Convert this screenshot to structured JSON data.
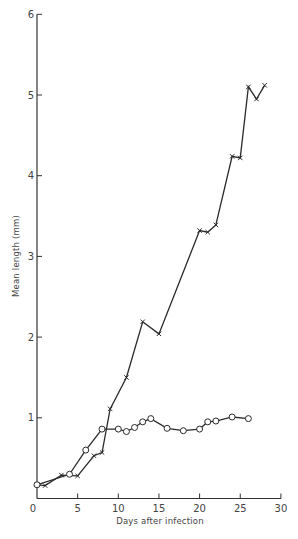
{
  "chart_data": {
    "type": "line",
    "title": "",
    "xlabel": "Days after infection",
    "ylabel": "Mean length (mm)",
    "xlim": [
      0,
      30
    ],
    "ylim": [
      0,
      6
    ],
    "xticks": [
      0,
      5,
      10,
      15,
      20,
      25,
      30
    ],
    "xtick_labels": [
      "0",
      "5",
      "10",
      "15",
      "20",
      "25",
      "30"
    ],
    "yticks": [
      1,
      2,
      3,
      4,
      5,
      6
    ],
    "ytick_labels": [
      "1",
      "2",
      "3",
      "4",
      "5",
      "6"
    ],
    "grid": false,
    "legend": null,
    "series": [
      {
        "name": "crosses",
        "marker": "x",
        "x": [
          0,
          1,
          3,
          5,
          7,
          8,
          9,
          11,
          13,
          15,
          20,
          21,
          22,
          24,
          25,
          26,
          27,
          28
        ],
        "y": [
          0.17,
          0.16,
          0.29,
          0.28,
          0.53,
          0.57,
          1.11,
          1.5,
          2.19,
          2.04,
          3.32,
          3.3,
          3.39,
          4.24,
          4.22,
          5.1,
          4.95,
          5.12
        ]
      },
      {
        "name": "circles",
        "marker": "o",
        "x": [
          0,
          4,
          6,
          8,
          10,
          11,
          12,
          13,
          14,
          16,
          18,
          20,
          21,
          22,
          24,
          26
        ],
        "y": [
          0.17,
          0.3,
          0.6,
          0.86,
          0.86,
          0.83,
          0.88,
          0.95,
          0.99,
          0.87,
          0.84,
          0.86,
          0.95,
          0.96,
          1.01,
          0.99
        ]
      }
    ]
  },
  "layout": {
    "x0": 37,
    "x_per_unit": 8.13,
    "y0": 498.5,
    "y_per_unit": 80.7,
    "x_axis_end": 281
  }
}
